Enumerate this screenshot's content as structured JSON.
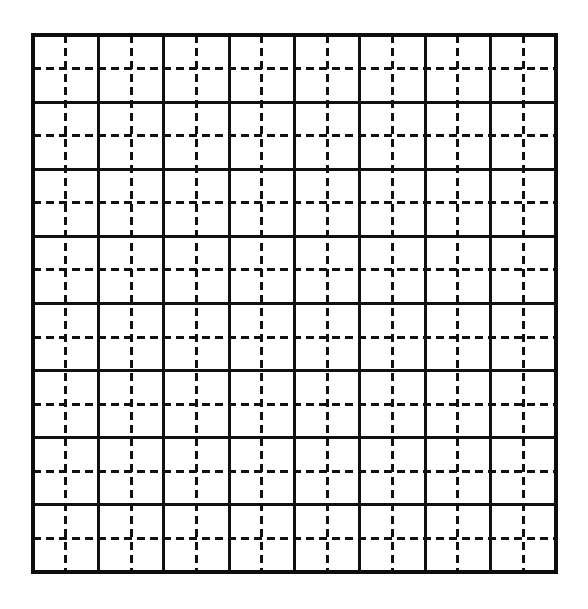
{
  "figure": {
    "kind": "grid-diagram",
    "background_color": "#ffffff",
    "ink_color": "#111111"
  },
  "grid": {
    "origin_x": 33,
    "origin_y": 35,
    "width": 523,
    "height": 537,
    "major_columns": 8,
    "major_rows": 8,
    "minor_divisions_per_cell": 2,
    "total_sub_columns": 16,
    "total_sub_rows": 16,
    "major_cell_width": 65.375,
    "major_cell_height": 67.125,
    "minor_cell_width": 32.6875,
    "minor_cell_height": 33.5625,
    "major_line_width": 3.2,
    "minor_line_width": 3.0,
    "border_line_width": 3.6,
    "dash_length": 8,
    "dash_gap": 5,
    "major_line_style": "solid",
    "minor_line_style": "dashed",
    "border_style": "solid"
  },
  "chart_data": {
    "type": "table",
    "title": "",
    "xlabel": "",
    "ylabel": "",
    "categories": [],
    "values": [],
    "grid": true,
    "legend_position": "none"
  }
}
